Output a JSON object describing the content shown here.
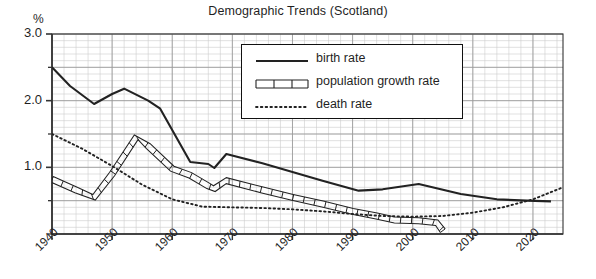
{
  "chart_data": {
    "type": "line",
    "title": "Demographic Trends (Scotland)",
    "xlabel": "",
    "ylabel": "%",
    "y_unit_label": "%",
    "xlim": [
      1940,
      2025
    ],
    "ylim": [
      0.0,
      3.0
    ],
    "y_major_ticks": [
      1.0,
      2.0,
      3.0
    ],
    "y_major_tick_labels": [
      "1.0",
      "2.0",
      "3.0"
    ],
    "y_minor_tick_values": [
      0.0,
      0.5,
      1.5,
      2.5
    ],
    "x_ticks": [
      1940,
      1950,
      1960,
      1970,
      1980,
      1990,
      2000,
      2010,
      2020
    ],
    "x_tick_labels": [
      "1940",
      "1950",
      "1960",
      "1970",
      "1980",
      "1990",
      "2000",
      "2010",
      "2020"
    ],
    "grid": true,
    "grid_minor": true,
    "grid_major_step_x": 10,
    "grid_minor_step_x": 2,
    "grid_major_step_y": 0.5,
    "grid_minor_step_y": 0.1,
    "legend_position": "upper center",
    "series": [
      {
        "name": "birth rate",
        "style": "solid",
        "points": [
          [
            1940,
            2.5
          ],
          [
            1943,
            2.22
          ],
          [
            1947,
            1.95
          ],
          [
            1950,
            2.1
          ],
          [
            1952,
            2.18
          ],
          [
            1956,
            2.0
          ],
          [
            1958,
            1.88
          ],
          [
            1963,
            1.08
          ],
          [
            1966,
            1.05
          ],
          [
            1967,
            0.99
          ],
          [
            1969,
            1.2
          ],
          [
            1975,
            1.06
          ],
          [
            1980,
            0.93
          ],
          [
            1985,
            0.8
          ],
          [
            1991,
            0.65
          ],
          [
            1995,
            0.67
          ],
          [
            2001,
            0.75
          ],
          [
            2008,
            0.6
          ],
          [
            2014,
            0.52
          ],
          [
            2019,
            0.5
          ],
          [
            2023,
            0.49
          ]
        ]
      },
      {
        "name": "population growth rate",
        "style": "ladder",
        "points": [
          [
            1940,
            0.82
          ],
          [
            1944,
            0.66
          ],
          [
            1947,
            0.55
          ],
          [
            1950,
            0.9
          ],
          [
            1954,
            1.45
          ],
          [
            1956,
            1.32
          ],
          [
            1960,
            0.98
          ],
          [
            1963,
            0.88
          ],
          [
            1966,
            0.72
          ],
          [
            1967,
            0.68
          ],
          [
            1969,
            0.8
          ],
          [
            1975,
            0.66
          ],
          [
            1980,
            0.55
          ],
          [
            1985,
            0.45
          ],
          [
            1990,
            0.34
          ],
          [
            1994,
            0.27
          ],
          [
            1997,
            0.21
          ],
          [
            2001,
            0.2
          ],
          [
            2004,
            0.17
          ],
          [
            2005,
            0.05
          ]
        ]
      },
      {
        "name": "death rate",
        "style": "dotted",
        "points": [
          [
            1940,
            1.5
          ],
          [
            1945,
            1.28
          ],
          [
            1950,
            1.02
          ],
          [
            1955,
            0.74
          ],
          [
            1960,
            0.52
          ],
          [
            1965,
            0.41
          ],
          [
            1970,
            0.4
          ],
          [
            1975,
            0.39
          ],
          [
            1980,
            0.37
          ],
          [
            1985,
            0.34
          ],
          [
            1990,
            0.3
          ],
          [
            1995,
            0.27
          ],
          [
            2000,
            0.26
          ],
          [
            2005,
            0.27
          ],
          [
            2010,
            0.32
          ],
          [
            2015,
            0.4
          ],
          [
            2020,
            0.52
          ],
          [
            2025,
            0.7
          ]
        ]
      }
    ]
  },
  "legend": {
    "items": [
      {
        "label": "birth rate",
        "style": "solid"
      },
      {
        "label": "population growth rate",
        "style": "ladder"
      },
      {
        "label": "death rate",
        "style": "dotted"
      }
    ]
  },
  "colors": {
    "line": "#222222",
    "grid_minor": "#cccccc",
    "grid_major": "#999999",
    "axis": "#333333",
    "background": "#ffffff",
    "text": "#1f1f1f"
  }
}
